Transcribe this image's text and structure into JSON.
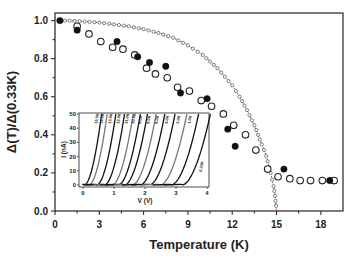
{
  "chart_data": {
    "type": "scatter",
    "title": "",
    "xlabel": "Temperature (K)",
    "ylabel": "Δ(T)/Δ(0.33K)",
    "xlim": [
      0,
      19.5
    ],
    "ylim": [
      0,
      1.04
    ],
    "xticks": [
      0,
      3,
      6,
      9,
      12,
      15,
      18
    ],
    "yticks": [
      0.0,
      0.2,
      0.4,
      0.6,
      0.8,
      1.0
    ],
    "ytick_labels": [
      "0.0",
      "0.2",
      "0.4",
      "0.6",
      "0.8",
      "1.0"
    ],
    "grid": false,
    "legend": null,
    "series": [
      {
        "name": "open circles",
        "marker": "open-circle",
        "x": [
          1.5,
          2.3,
          3.1,
          3.9,
          4.6,
          5.4,
          6.2,
          6.8,
          7.6,
          8.3,
          9.1,
          9.9,
          10.6,
          11.4,
          12.1,
          12.9,
          13.6,
          14.4,
          15.1,
          15.9,
          16.6,
          17.3,
          18.1,
          18.9
        ],
        "y": [
          0.97,
          0.93,
          0.89,
          0.86,
          0.85,
          0.82,
          0.75,
          0.72,
          0.7,
          0.65,
          0.63,
          0.58,
          0.55,
          0.51,
          0.45,
          0.4,
          0.32,
          0.22,
          0.18,
          0.17,
          0.16,
          0.16,
          0.16,
          0.16
        ]
      },
      {
        "name": "filled circles",
        "marker": "filled-circle",
        "x": [
          0.33,
          1.5,
          4.2,
          5.6,
          6.4,
          7.5,
          8.5,
          10.3,
          11.7,
          12.2,
          15.5,
          18.6
        ],
        "y": [
          1.0,
          0.95,
          0.89,
          0.81,
          0.78,
          0.76,
          0.62,
          0.59,
          0.43,
          0.34,
          0.22,
          0.16
        ]
      },
      {
        "name": "BCS fit",
        "marker": "small-open-circle-dotted-line",
        "Tc": 15.0,
        "x": [
          0.33,
          1,
          2,
          3,
          4,
          5,
          6,
          7,
          8,
          9,
          10,
          11,
          12,
          12.5,
          13,
          13.5,
          14,
          14.3,
          14.6,
          14.8,
          14.9,
          15.0
        ],
        "y": [
          1.0,
          1.0,
          0.995,
          0.99,
          0.98,
          0.97,
          0.955,
          0.935,
          0.91,
          0.87,
          0.82,
          0.75,
          0.66,
          0.6,
          0.53,
          0.45,
          0.35,
          0.29,
          0.2,
          0.13,
          0.08,
          0.0
        ]
      }
    ],
    "inset": {
      "type": "line",
      "xlabel": "V (V)",
      "ylabel": "I (nA)",
      "xlim": [
        0,
        4
      ],
      "ylim": [
        0,
        50
      ],
      "xticks": [
        0,
        1,
        2,
        3,
        4
      ],
      "yticks": [
        0,
        10,
        20,
        30,
        40,
        50
      ],
      "curve_labels": [
        "15.0K",
        "14.0K",
        "13.0K",
        "12.0K",
        "11.0K",
        "10.0K",
        "9.0K",
        "8.0K",
        "6.0K",
        "4.0K",
        "2.0K",
        "1.0K",
        "0.33K"
      ],
      "curve_onsets_V": [
        0.05,
        0.2,
        0.45,
        0.7,
        0.95,
        1.15,
        1.35,
        1.6,
        1.85,
        2.15,
        2.5,
        2.85,
        3.2
      ]
    }
  }
}
